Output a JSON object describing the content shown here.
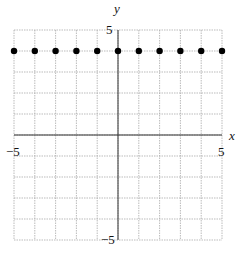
{
  "chart_data": {
    "type": "scatter",
    "title": "",
    "xlabel": "x",
    "ylabel": "y",
    "xlim": [
      -5,
      5
    ],
    "ylim": [
      -5,
      5
    ],
    "grid": true,
    "tick_labels": {
      "x_min": "−5",
      "x_max": "5",
      "y_min": "−5",
      "y_max": "5"
    },
    "series": [
      {
        "name": "points",
        "x": [
          -5,
          -4,
          -3,
          -2,
          -1,
          0,
          1,
          2,
          3,
          4,
          5
        ],
        "y": [
          4,
          4,
          4,
          4,
          4,
          4,
          4,
          4,
          4,
          4,
          4
        ]
      }
    ]
  }
}
